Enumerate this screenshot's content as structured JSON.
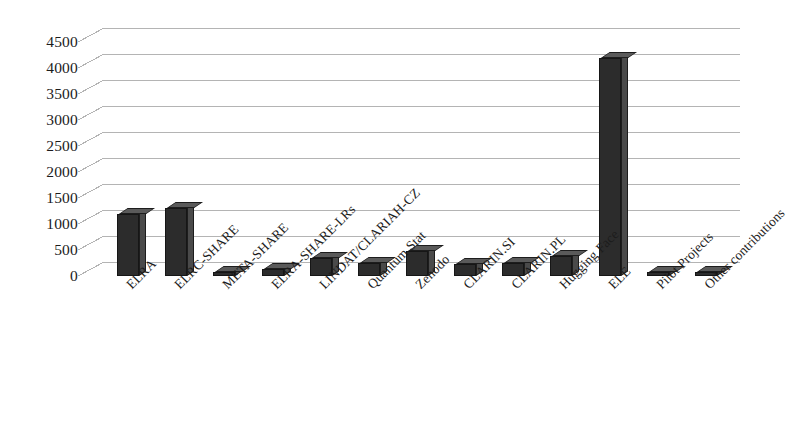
{
  "chart_data": {
    "type": "bar",
    "title": "",
    "subtitle": "",
    "xlabel": "",
    "ylabel": "",
    "ylim": [
      0,
      4500
    ],
    "ytick_step": 500,
    "yticks": [
      4500,
      4000,
      3500,
      3000,
      2500,
      2000,
      1500,
      1000,
      500,
      0
    ],
    "grid": true,
    "legend": false,
    "legend_position": "none",
    "style": "3d-column-excel",
    "bar_color": "#2c2c2c",
    "bar_side_color": "#4a4a4a",
    "bar_top_color": "#5a5a5a",
    "gridline_color": "#b4b4b4",
    "background_color": "#ffffff",
    "categories": [
      "ELRA",
      "ELRC-SHARE",
      "META-SHARE",
      "ELRA-SHARE-LRs",
      "LINDAT/CLARIAH-CZ",
      "Quantum Stat",
      "Zenodo",
      "CLARIN.SI",
      "CLARIN.PL",
      "Hugging Face",
      "ELE",
      "Pilot Projects",
      "Other contributions"
    ],
    "values": [
      1200,
      1300,
      60,
      130,
      350,
      250,
      480,
      230,
      250,
      380,
      4200,
      40,
      40
    ]
  },
  "axes": {
    "y_axis_name": "value-axis",
    "x_axis_name": "category-axis"
  }
}
